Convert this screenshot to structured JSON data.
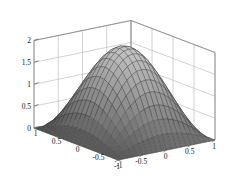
{
  "figure": {
    "kind": "matlab-surface-plot",
    "background_color": "#ffffff",
    "axis_color": "#8c8c8c",
    "grid_color": "#b4b4b4",
    "mesh_edge_color": "#2e2e2e",
    "colormap": "gray"
  },
  "chart_data": {
    "type": "surface",
    "title": "",
    "xlabel": "",
    "ylabel": "",
    "zlabel": "",
    "grid": true,
    "legend": null,
    "shading": "gray-colormap-faceted",
    "mesh_n": 21,
    "surface_formula": "z = 2*cos(pi*x/2)*cos(pi*y/2)",
    "x": [
      -1,
      -0.9,
      -0.8,
      -0.7,
      -0.6,
      -0.5,
      -0.4,
      -0.3,
      -0.2,
      -0.1,
      0,
      0.1,
      0.2,
      0.3,
      0.4,
      0.5,
      0.6,
      0.7,
      0.8,
      0.9,
      1
    ],
    "y": [
      -1,
      -0.9,
      -0.8,
      -0.7,
      -0.6,
      -0.5,
      -0.4,
      -0.3,
      -0.2,
      -0.1,
      0,
      0.1,
      0.2,
      0.3,
      0.4,
      0.5,
      0.6,
      0.7,
      0.8,
      0.9,
      1
    ],
    "xlim": [
      -1,
      1
    ],
    "ylim": [
      -1,
      1
    ],
    "zlim": [
      0,
      2
    ],
    "zmax": 2,
    "zmin": 0,
    "x_ticks": [
      -1,
      -0.5,
      0,
      0.5,
      1
    ],
    "y_ticks": [
      -1,
      -0.5,
      0,
      0.5,
      1
    ],
    "z_ticks": [
      0,
      0.5,
      1,
      1.5,
      2
    ],
    "x_ticklabels": [
      "-1",
      "-0.5",
      "0",
      "0.5",
      "1"
    ],
    "y_ticklabels": [
      "1",
      "0.5",
      "0",
      "-0.5",
      "-1"
    ],
    "z_ticklabels": [
      "0",
      "0.5",
      "1",
      "1.5",
      "2"
    ],
    "view": {
      "azimuth": -37.5,
      "elevation": 30
    }
  },
  "axes": {
    "z_axis": {
      "name": "vertical-axis",
      "labels": [
        "0",
        "0.5",
        "1",
        "1.5",
        "2"
      ]
    },
    "y_axis": {
      "name": "left-depth-axis",
      "labels": [
        "1",
        "0.5",
        "0",
        "-0.5",
        "-1"
      ]
    },
    "x_axis": {
      "name": "right-depth-axis",
      "labels": [
        "-1",
        "-0.5",
        "0",
        "0.5",
        "1"
      ]
    }
  }
}
